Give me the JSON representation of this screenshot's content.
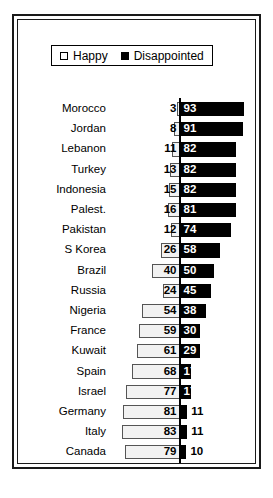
{
  "chart_data": {
    "type": "bar",
    "title": "",
    "subtitle": "",
    "xlabel": "",
    "ylabel": "",
    "orientation": "horizontal-diverging",
    "grid": false,
    "legend_position": "top-center",
    "xlim": [
      0,
      100
    ],
    "categories": [
      "Morocco",
      "Jordan",
      "Lebanon",
      "Turkey",
      "Indonesia",
      "Palest.",
      "Pakistan",
      "S Korea",
      "Brazil",
      "Russia",
      "Nigeria",
      "France",
      "Kuwait",
      "Spain",
      "Israel",
      "Germany",
      "Italy",
      "Canada"
    ],
    "series": [
      {
        "name": "Happy",
        "color": "#f2f2f2",
        "values": [
          3,
          8,
          11,
          13,
          15,
          16,
          12,
          26,
          40,
          24,
          54,
          59,
          61,
          68,
          77,
          81,
          83,
          79
        ]
      },
      {
        "name": "Disappointed",
        "color": "#000000",
        "values": [
          93,
          91,
          82,
          82,
          82,
          81,
          74,
          58,
          50,
          45,
          38,
          30,
          29,
          17,
          17,
          11,
          11,
          10
        ]
      }
    ]
  },
  "legend": {
    "items": [
      {
        "label": "Happy",
        "marker": "open-square-marker"
      },
      {
        "label": "Disappointed",
        "marker": "filled-square-marker"
      }
    ]
  }
}
